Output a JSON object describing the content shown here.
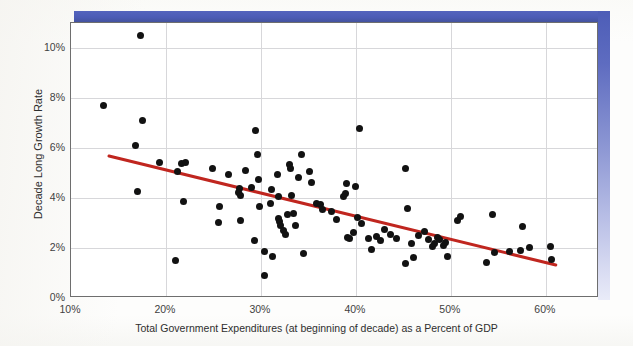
{
  "figure": {
    "decoration": {
      "top_band_color": "#4c5cb6",
      "right_band_color_top": "#4d5db7",
      "right_band_color_bottom": "#e9ebf8"
    }
  },
  "chart_data": {
    "type": "scatter",
    "title": "",
    "xlabel": "Total Government Expenditures (at beginning of decade) as a Percent of GDP",
    "ylabel": "Decade Long Growth Rate",
    "xlim": [
      10,
      65.6
    ],
    "ylim": [
      0,
      11
    ],
    "grid": true,
    "legend": null,
    "xticks": [
      10,
      20,
      30,
      40,
      50,
      60
    ],
    "xtick_labels": [
      "10%",
      "20%",
      "30%",
      "40%",
      "50%",
      "60%"
    ],
    "yticks": [
      0,
      2,
      4,
      6,
      8,
      10
    ],
    "ytick_labels": [
      "0%",
      "2%",
      "4%",
      "6%",
      "8%",
      "10%"
    ],
    "marker": {
      "shape": "circle",
      "color": "#121212",
      "size_px": 7
    },
    "trendline": {
      "type": "linear",
      "color": "#c0261f",
      "width_px": 3,
      "x_start": 14.0,
      "y_start": 5.68,
      "x_end": 61.05,
      "y_end": 1.32
    },
    "points": [
      {
        "x": 13.4,
        "y": 7.72
      },
      {
        "x": 17.3,
        "y": 10.52
      },
      {
        "x": 17.5,
        "y": 7.1
      },
      {
        "x": 16.8,
        "y": 6.1
      },
      {
        "x": 17.0,
        "y": 4.26
      },
      {
        "x": 19.3,
        "y": 5.44
      },
      {
        "x": 21.2,
        "y": 5.06
      },
      {
        "x": 21.6,
        "y": 5.37
      },
      {
        "x": 22.1,
        "y": 5.42
      },
      {
        "x": 21.0,
        "y": 1.52
      },
      {
        "x": 21.8,
        "y": 3.88
      },
      {
        "x": 24.9,
        "y": 5.18
      },
      {
        "x": 25.6,
        "y": 3.68
      },
      {
        "x": 25.5,
        "y": 3.02
      },
      {
        "x": 26.6,
        "y": 4.96
      },
      {
        "x": 27.7,
        "y": 4.38
      },
      {
        "x": 27.6,
        "y": 4.22
      },
      {
        "x": 27.8,
        "y": 4.12
      },
      {
        "x": 27.9,
        "y": 3.1
      },
      {
        "x": 28.4,
        "y": 5.12
      },
      {
        "x": 29.0,
        "y": 4.42
      },
      {
        "x": 29.4,
        "y": 6.7
      },
      {
        "x": 29.6,
        "y": 5.76
      },
      {
        "x": 29.7,
        "y": 4.76
      },
      {
        "x": 29.3,
        "y": 2.3
      },
      {
        "x": 29.9,
        "y": 3.68
      },
      {
        "x": 30.4,
        "y": 1.86
      },
      {
        "x": 30.4,
        "y": 0.9
      },
      {
        "x": 31.1,
        "y": 4.34
      },
      {
        "x": 31.0,
        "y": 3.78
      },
      {
        "x": 31.2,
        "y": 1.68
      },
      {
        "x": 31.7,
        "y": 4.96
      },
      {
        "x": 31.8,
        "y": 4.06
      },
      {
        "x": 31.9,
        "y": 3.2
      },
      {
        "x": 32.0,
        "y": 3.06
      },
      {
        "x": 32.1,
        "y": 2.9
      },
      {
        "x": 32.4,
        "y": 2.72
      },
      {
        "x": 32.6,
        "y": 2.56
      },
      {
        "x": 32.8,
        "y": 3.34
      },
      {
        "x": 33.0,
        "y": 5.34
      },
      {
        "x": 33.1,
        "y": 5.2
      },
      {
        "x": 33.2,
        "y": 4.12
      },
      {
        "x": 33.4,
        "y": 3.4
      },
      {
        "x": 33.6,
        "y": 2.9
      },
      {
        "x": 34.0,
        "y": 4.84
      },
      {
        "x": 34.3,
        "y": 5.76
      },
      {
        "x": 34.5,
        "y": 1.8
      },
      {
        "x": 35.1,
        "y": 5.08
      },
      {
        "x": 35.3,
        "y": 4.64
      },
      {
        "x": 35.8,
        "y": 3.8
      },
      {
        "x": 36.3,
        "y": 3.74
      },
      {
        "x": 36.5,
        "y": 3.54
      },
      {
        "x": 37.4,
        "y": 3.46
      },
      {
        "x": 38.0,
        "y": 3.14
      },
      {
        "x": 38.7,
        "y": 4.08
      },
      {
        "x": 38.9,
        "y": 4.18
      },
      {
        "x": 39.0,
        "y": 4.58
      },
      {
        "x": 39.1,
        "y": 2.42
      },
      {
        "x": 39.3,
        "y": 2.38
      },
      {
        "x": 39.7,
        "y": 2.64
      },
      {
        "x": 40.0,
        "y": 4.48
      },
      {
        "x": 40.2,
        "y": 3.22
      },
      {
        "x": 40.4,
        "y": 6.78
      },
      {
        "x": 40.6,
        "y": 2.98
      },
      {
        "x": 41.3,
        "y": 2.38
      },
      {
        "x": 41.6,
        "y": 1.96
      },
      {
        "x": 42.2,
        "y": 2.48
      },
      {
        "x": 42.6,
        "y": 2.32
      },
      {
        "x": 43.0,
        "y": 2.76
      },
      {
        "x": 43.6,
        "y": 2.56
      },
      {
        "x": 44.3,
        "y": 2.4
      },
      {
        "x": 45.2,
        "y": 5.2
      },
      {
        "x": 45.4,
        "y": 3.6
      },
      {
        "x": 45.2,
        "y": 1.4
      },
      {
        "x": 45.9,
        "y": 2.2
      },
      {
        "x": 46.1,
        "y": 1.62
      },
      {
        "x": 46.6,
        "y": 2.52
      },
      {
        "x": 47.2,
        "y": 2.68
      },
      {
        "x": 47.6,
        "y": 2.36
      },
      {
        "x": 48.1,
        "y": 2.08
      },
      {
        "x": 48.3,
        "y": 2.2
      },
      {
        "x": 48.6,
        "y": 2.42
      },
      {
        "x": 48.8,
        "y": 2.36
      },
      {
        "x": 49.2,
        "y": 2.1
      },
      {
        "x": 49.4,
        "y": 2.22
      },
      {
        "x": 49.6,
        "y": 1.68
      },
      {
        "x": 50.7,
        "y": 3.1
      },
      {
        "x": 51.0,
        "y": 3.28
      },
      {
        "x": 53.8,
        "y": 1.44
      },
      {
        "x": 54.4,
        "y": 3.36
      },
      {
        "x": 54.6,
        "y": 1.82
      },
      {
        "x": 56.2,
        "y": 1.88
      },
      {
        "x": 57.3,
        "y": 1.9
      },
      {
        "x": 57.5,
        "y": 2.88
      },
      {
        "x": 58.3,
        "y": 2.02
      },
      {
        "x": 60.5,
        "y": 2.06
      },
      {
        "x": 60.6,
        "y": 1.56
      }
    ]
  }
}
